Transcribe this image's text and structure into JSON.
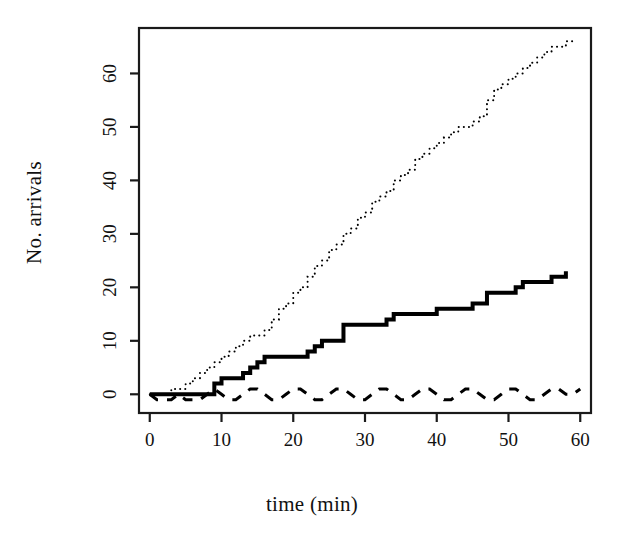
{
  "chart_data": {
    "type": "line",
    "title": "",
    "subtitle": "",
    "xlabel": "time (min)",
    "ylabel": "No. arrivals",
    "xlim": [
      -1.5,
      61.5
    ],
    "ylim": [
      -3.5,
      68.5
    ],
    "xticks": [
      0,
      10,
      20,
      30,
      40,
      50,
      60
    ],
    "yticks": [
      0,
      10,
      20,
      30,
      40,
      50,
      60
    ],
    "xtick_labels": [
      "0",
      "10",
      "20",
      "30",
      "40",
      "50",
      "60"
    ],
    "ytick_labels": [
      "0",
      "10",
      "20",
      "30",
      "40",
      "50",
      "60"
    ],
    "grid": false,
    "legend_position": "none",
    "box": true,
    "colors": {
      "line": "#000000",
      "axis": "#1a1a1a",
      "background": "#ffffff"
    },
    "series": [
      {
        "name": "dotted-cumulative-arrivals",
        "style": "dotted",
        "linewidth": 2,
        "step": "post",
        "x": [
          0,
          1,
          2,
          3,
          4,
          5,
          6,
          7,
          8,
          9,
          10,
          11,
          12,
          13,
          14,
          15,
          16,
          17,
          18,
          19,
          20,
          21,
          22,
          23,
          24,
          25,
          26,
          27,
          28,
          29,
          30,
          31,
          32,
          33,
          34,
          35,
          36,
          37,
          38,
          39,
          40,
          41,
          42,
          43,
          44,
          45,
          46,
          47,
          48,
          49,
          50,
          51,
          52,
          53,
          54,
          55,
          56,
          57,
          58,
          59
        ],
        "y": [
          0,
          0,
          0,
          1,
          1,
          2,
          3,
          4,
          5,
          6,
          7,
          8,
          9,
          10,
          11,
          11,
          12,
          14,
          16,
          17,
          19,
          20,
          22,
          24,
          25,
          27,
          28,
          30,
          31,
          33,
          34,
          36,
          37,
          38,
          40,
          41,
          42,
          44,
          45,
          46,
          47,
          48,
          49,
          50,
          50,
          51,
          52,
          55,
          57,
          58,
          59,
          60,
          61,
          62,
          63,
          64,
          65,
          65,
          66,
          66
        ]
      },
      {
        "name": "solid-cumulative-arrivals",
        "style": "solid",
        "linewidth": 4,
        "step": "post",
        "x": [
          0,
          1,
          2,
          3,
          4,
          5,
          6,
          7,
          8,
          9,
          10,
          11,
          12,
          13,
          14,
          15,
          16,
          17,
          18,
          19,
          20,
          21,
          22,
          23,
          24,
          25,
          26,
          27,
          28,
          29,
          30,
          31,
          32,
          33,
          34,
          35,
          36,
          37,
          38,
          39,
          40,
          41,
          42,
          43,
          44,
          45,
          46,
          47,
          48,
          49,
          50,
          51,
          52,
          53,
          54,
          55,
          56,
          57,
          58
        ],
        "y": [
          0,
          0,
          0,
          0,
          0,
          0,
          0,
          0,
          0,
          2,
          3,
          3,
          3,
          4,
          5,
          6,
          7,
          7,
          7,
          7,
          7,
          7,
          8,
          9,
          10,
          10,
          10,
          13,
          13,
          13,
          13,
          13,
          13,
          14,
          15,
          15,
          15,
          15,
          15,
          15,
          16,
          16,
          16,
          16,
          16,
          17,
          17,
          19,
          19,
          19,
          19,
          20,
          21,
          21,
          21,
          21,
          22,
          22,
          23
        ]
      },
      {
        "name": "dashed-oscillating-series",
        "style": "dashed",
        "linewidth": 3,
        "step": "none",
        "x": [
          0,
          1,
          2,
          3,
          4,
          5,
          6,
          7,
          8,
          9,
          10,
          11,
          12,
          13,
          14,
          15,
          16,
          17,
          18,
          19,
          20,
          21,
          22,
          23,
          24,
          25,
          26,
          27,
          28,
          29,
          30,
          31,
          32,
          33,
          34,
          35,
          36,
          37,
          38,
          39,
          40,
          41,
          42,
          43,
          44,
          45,
          46,
          47,
          48,
          49,
          50,
          51,
          52,
          53,
          54,
          55,
          56,
          57,
          58,
          59,
          60
        ],
        "y": [
          0,
          -1,
          -1,
          -1,
          0,
          -1,
          -1,
          -1,
          0,
          1,
          0,
          -1,
          -1,
          0,
          1,
          1,
          0,
          -1,
          -1,
          0,
          1,
          1,
          0,
          -1,
          -1,
          0,
          1,
          1,
          0,
          -1,
          -1,
          0,
          1,
          1,
          0,
          -1,
          -1,
          0,
          1,
          1,
          0,
          -1,
          -1,
          0,
          1,
          1,
          0,
          -1,
          -1,
          0,
          1,
          1,
          0,
          -1,
          -1,
          0,
          1,
          1,
          0,
          0,
          1
        ]
      }
    ]
  },
  "plot_geometry": {
    "box_left": 139,
    "box_right": 591,
    "box_top": 28,
    "box_bottom": 413,
    "tick_length": 9
  }
}
